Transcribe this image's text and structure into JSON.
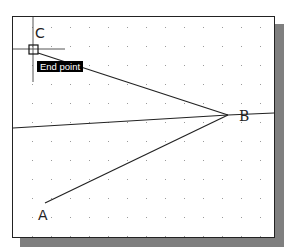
{
  "drawing": {
    "points": {
      "A": {
        "label": "A",
        "x": 45,
        "y": 203
      },
      "B": {
        "label": "B",
        "x": 228,
        "y": 115
      },
      "C": {
        "label": "C",
        "x": 33,
        "y": 49
      }
    },
    "grid": {
      "spacing": 19,
      "origin_x": 13,
      "origin_y": 8,
      "dot_color": "#9a9a9a"
    },
    "line_color": "#222222"
  },
  "cursor": {
    "x": 33,
    "y": 49,
    "snap_marker": "endpoint-square"
  },
  "tooltip": {
    "text": "End point"
  },
  "colors": {
    "shadow": "#7f7f7f",
    "border": "#222222",
    "tooltip_bg": "#000000",
    "tooltip_fg": "#ffffff"
  }
}
